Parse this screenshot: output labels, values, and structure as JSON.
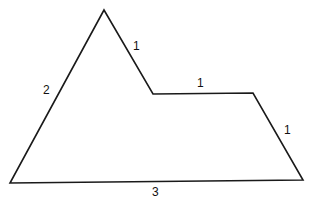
{
  "figure": {
    "type": "polygon",
    "vertices": [
      [
        104,
        10
      ],
      [
        153,
        94
      ],
      [
        253,
        93
      ],
      [
        303,
        180
      ],
      [
        10,
        183
      ]
    ],
    "stroke_color": "#1a1a1a",
    "labels": [
      {
        "side": "top-left-upper-edge",
        "text": "1",
        "x": 133,
        "y": 41
      },
      {
        "side": "notch-horizontal-edge",
        "text": "1",
        "x": 199,
        "y": 79
      },
      {
        "side": "right-slanted-edge",
        "text": "1",
        "x": 284,
        "y": 126
      },
      {
        "side": "left-long-edge",
        "text": "2",
        "x": 44,
        "y": 86
      },
      {
        "side": "bottom-edge",
        "text": "3",
        "x": 152,
        "y": 187
      }
    ]
  }
}
